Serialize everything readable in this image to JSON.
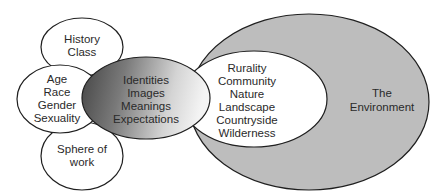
{
  "diagram": {
    "nodes": {
      "history_class": {
        "lines": [
          "History",
          "Class"
        ]
      },
      "age_race": {
        "lines": [
          "Age",
          "Race",
          "Gender",
          "Sexuality"
        ]
      },
      "sphere_work": {
        "lines": [
          "Sphere of",
          "work"
        ]
      },
      "identities": {
        "lines": [
          "Identities",
          "Images",
          "Meanings",
          "Expectations"
        ]
      },
      "rurality": {
        "lines": [
          "Rurality",
          "Community",
          "Nature",
          "Landscape",
          "Countryside",
          "Wilderness"
        ]
      },
      "environment": {
        "lines": [
          "The",
          "Environment"
        ]
      }
    },
    "colors": {
      "environment_fill": "#bdbdbd",
      "gradient_dark": "#4a4a4a",
      "gradient_light": "#f2f2f2",
      "outline": "#1f1f1f",
      "white_fill": "#ffffff"
    }
  }
}
